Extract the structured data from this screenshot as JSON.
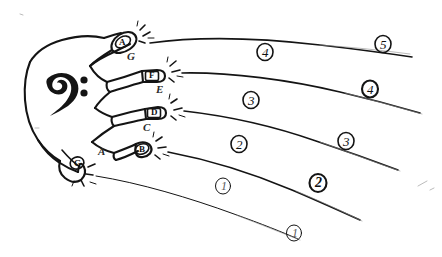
{
  "canvas": {
    "width": 442,
    "height": 257,
    "background_color": "#ffffff",
    "ink_color": "#111111",
    "description": "Hand-drawn sketch of a right hand with a bass clef in the palm, fingertips labeled with note letters, and strings radiating to the right marked with circled numbers."
  },
  "clef": {
    "name": "bass-clef",
    "glyph": "𝄢"
  },
  "fingertips": [
    {
      "id": "tip-index",
      "label": "A",
      "shape": "box-oval",
      "x": 122,
      "y": 40
    },
    {
      "id": "tip-middle",
      "label": "F",
      "shape": "box",
      "x": 152,
      "y": 73
    },
    {
      "id": "tip-ring",
      "label": "D",
      "shape": "box",
      "x": 152,
      "y": 110
    },
    {
      "id": "tip-pinky",
      "label": "B",
      "shape": "oval",
      "x": 137,
      "y": 148
    },
    {
      "id": "tip-thumb",
      "label": "G",
      "shape": "oval",
      "x": 76,
      "y": 163
    }
  ],
  "note_letters": [
    {
      "id": "note-g",
      "label": "G",
      "x": 130,
      "y": 57
    },
    {
      "id": "note-e",
      "label": "E",
      "x": 159,
      "y": 90
    },
    {
      "id": "note-c",
      "label": "C",
      "x": 146,
      "y": 128
    },
    {
      "id": "note-a",
      "label": "A",
      "x": 101,
      "y": 152
    }
  ],
  "string_numbers": [
    {
      "id": "string-num-5-upper",
      "label": "5",
      "x": 383,
      "y": 44
    },
    {
      "id": "string-num-4-upper",
      "label": "4",
      "x": 265,
      "y": 52
    },
    {
      "id": "string-num-4-lower",
      "label": "4",
      "x": 370,
      "y": 89
    },
    {
      "id": "string-num-3-upper",
      "label": "3",
      "x": 251,
      "y": 100
    },
    {
      "id": "string-num-3-lower",
      "label": "3",
      "x": 346,
      "y": 141
    },
    {
      "id": "string-num-2-upper",
      "label": "2",
      "x": 239,
      "y": 144
    },
    {
      "id": "string-num-2-lower",
      "label": "2",
      "x": 318,
      "y": 183
    },
    {
      "id": "string-num-1-upper",
      "label": "1",
      "x": 223,
      "y": 186
    },
    {
      "id": "string-num-1-lower",
      "label": "1",
      "x": 294,
      "y": 233
    }
  ]
}
